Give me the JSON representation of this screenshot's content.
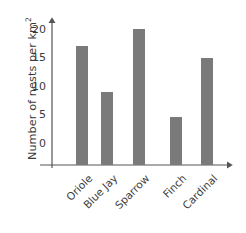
{
  "chart_data": {
    "type": "bar",
    "title": "",
    "xlabel": "",
    "ylabel": "Number of nests per km",
    "ylabel_exponent": "2",
    "categories": [
      "Oriole",
      "Blue Jay",
      "Sparrow",
      "Finch",
      "Cardinal"
    ],
    "values": [
      17,
      9,
      20,
      4.5,
      15
    ],
    "ylim": [
      0,
      22
    ],
    "yticks": [
      0,
      5,
      10,
      15,
      20
    ],
    "ytick_labels": [
      "0",
      "5",
      "10",
      "15",
      "20"
    ],
    "grid": false,
    "legend": null,
    "bar_color": "#7a7a7a",
    "axis_color": "#555555",
    "text_color": "#3b3b3b",
    "background": "#ffffff"
  },
  "axis_geometry": {
    "y_zero_px": 143,
    "px_per_unit": 5.7,
    "baseline_px": 165,
    "axis_x_px": 52,
    "bar_width_px": 12,
    "bar_left_px": [
      76,
      101,
      133,
      170,
      201
    ]
  }
}
